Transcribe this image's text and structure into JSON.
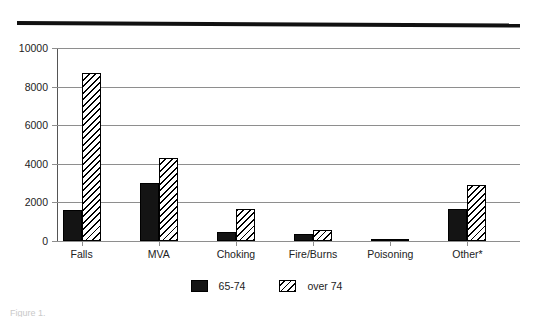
{
  "figure": {
    "top_rule": "horizontal-rule",
    "caption_ghost": "Figure 1."
  },
  "legend": {
    "position": "bottom-center",
    "items": [
      {
        "label": "65-74",
        "pattern": "solid-black"
      },
      {
        "label": "over 74",
        "pattern": "diagonal-hatch"
      }
    ]
  },
  "chart_data": {
    "type": "bar",
    "title": "",
    "subtitle": "",
    "xlabel": "",
    "ylabel": "",
    "ylim": [
      0,
      10000
    ],
    "ytick_labels": [
      "0",
      "2000",
      "4000",
      "6000",
      "8000",
      "10000"
    ],
    "yticks": [
      0,
      2000,
      4000,
      6000,
      8000,
      10000
    ],
    "grid": true,
    "grid_axis": "y",
    "legend_position": "bottom-center",
    "categories": [
      "Falls",
      "MVA",
      "Choking",
      "Fire/Burns",
      "Poisoning",
      "Other*"
    ],
    "series": [
      {
        "name": "65-74",
        "pattern": "solid-black",
        "color": "#141414",
        "values": [
          1600,
          3000,
          450,
          360,
          100,
          1650
        ]
      },
      {
        "name": "over 74",
        "pattern": "diagonal-hatch",
        "color": "#ffffff",
        "values": [
          8700,
          4300,
          1650,
          570,
          130,
          2900
        ]
      }
    ],
    "annotations": [
      "Other* denotes a footnoted category"
    ]
  }
}
